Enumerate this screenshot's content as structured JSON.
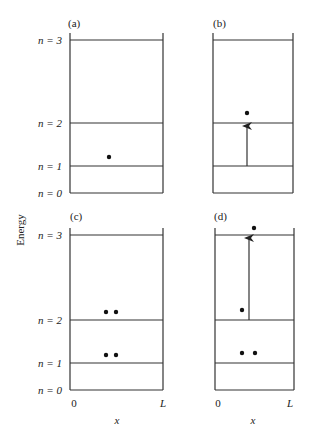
{
  "figure": {
    "ylabel": "Energy",
    "panels": [
      {
        "id": "a",
        "label": "(a)"
      },
      {
        "id": "b",
        "label": "(b)"
      },
      {
        "id": "c",
        "label": "(c)"
      },
      {
        "id": "d",
        "label": "(d)"
      }
    ],
    "levels": [
      "n = 3",
      "n = 2",
      "n = 1",
      "n = 0"
    ],
    "x_axis": {
      "start": "0",
      "end": "L",
      "label": "x"
    }
  }
}
